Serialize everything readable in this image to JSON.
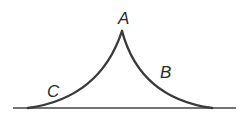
{
  "diagram": {
    "labels": {
      "peak": "A",
      "right_curve": "B",
      "left_curve": "C"
    },
    "colors": {
      "stroke": "#3a3a3a",
      "baseline": "#444444",
      "text": "#2a2a2a"
    }
  }
}
